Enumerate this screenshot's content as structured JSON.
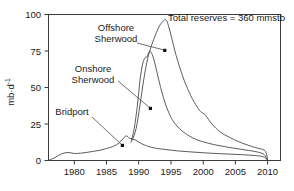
{
  "chart_data": {
    "type": "line",
    "title": "",
    "xlabel": "",
    "ylabel": "mb·d",
    "ylabel_sup": "-1",
    "xlim": [
      1976,
      2012
    ],
    "ylim": [
      0,
      100
    ],
    "grid": false,
    "legend_position": "inline-annotations",
    "x_ticks": [
      "1980",
      "1985",
      "1990",
      "1995",
      "2000",
      "2005",
      "2010"
    ],
    "x_tick_values": [
      1980,
      1985,
      1990,
      1995,
      2000,
      2005,
      2010
    ],
    "y_ticks": [
      "0",
      "25",
      "50",
      "75",
      "100"
    ],
    "y_tick_values": [
      0,
      25,
      50,
      75,
      100
    ],
    "annotations": [
      {
        "id": "total-reserves",
        "text": "Total reserves = 360 mmstb",
        "x": 1994.0,
        "y": 96.0
      },
      {
        "id": "offshore-sherwood",
        "line1": "Offshore",
        "line2": "Sherwood",
        "point_x": 1994.0,
        "point_y": 75.0
      },
      {
        "id": "onshore-sherwood",
        "line1": "Onshore",
        "line2": "Sherwood",
        "point_x": 1992.0,
        "point_y": 36.0
      },
      {
        "id": "bridport",
        "line1": "Bridport",
        "line2": "",
        "point_x": 1988.0,
        "point_y": 11.0
      }
    ],
    "series": [
      {
        "name": "Bridport",
        "color": "#4a4a4a",
        "x": [
          1976.0,
          1977.0,
          1978.0,
          1979.0,
          1980.0,
          1981.0,
          1982.0,
          1983.0,
          1984.0,
          1985.0,
          1986.0,
          1987.0,
          1988.0,
          1988.6,
          1989.5,
          1990.5,
          1992.0,
          1994.0,
          1996.0,
          1998.0,
          2000.0,
          2002.0,
          2004.0,
          2006.0,
          2008.0,
          2009.3,
          2009.8,
          2010.0
        ],
        "values": [
          0.0,
          2.0,
          4.5,
          5.5,
          4.8,
          5.0,
          5.6,
          6.3,
          7.0,
          8.2,
          9.6,
          12.2,
          16.8,
          15.2,
          14.0,
          11.4,
          9.0,
          7.6,
          6.6,
          5.9,
          5.3,
          4.8,
          4.4,
          4.0,
          3.4,
          2.6,
          1.0,
          0.0
        ]
      },
      {
        "name": "Onshore Sherwood",
        "color": "#4a4a4a",
        "x": [
          1988.8,
          1989.3,
          1989.8,
          1990.2,
          1990.6,
          1991.0,
          1991.3,
          1991.6,
          1991.9,
          1992.3,
          1992.8,
          1993.4,
          1994.2,
          1995.2,
          1996.4,
          1997.6,
          1999.0,
          2000.5,
          2002.0,
          2004.0,
          2006.0,
          2008.0,
          2009.3,
          2009.8,
          2010.0
        ],
        "values": [
          12.5,
          22.0,
          38.0,
          55.0,
          66.0,
          70.5,
          71.0,
          74.5,
          74.2,
          70.0,
          61.0,
          50.0,
          38.0,
          28.0,
          21.5,
          17.5,
          14.2,
          12.2,
          10.6,
          9.0,
          7.6,
          6.2,
          4.6,
          1.8,
          0.0
        ]
      },
      {
        "name": "Total",
        "color": "#4a4a4a",
        "x": [
          1989.0,
          1989.6,
          1990.2,
          1990.8,
          1991.4,
          1992.0,
          1992.6,
          1993.2,
          1993.8,
          1994.2,
          1994.5,
          1995.0,
          1995.8,
          1996.8,
          1997.8,
          1998.8,
          1999.6,
          2000.3,
          2001.0,
          2002.0,
          2003.0,
          2004.5,
          2006.0,
          2008.0,
          2009.5,
          2009.9,
          2010.0
        ],
        "values": [
          14.0,
          22.0,
          38.0,
          56.0,
          70.0,
          79.0,
          86.0,
          92.0,
          95.5,
          96.3,
          94.0,
          86.0,
          72.0,
          58.0,
          47.0,
          38.5,
          33.5,
          31.5,
          27.0,
          22.0,
          18.5,
          15.0,
          12.0,
          9.0,
          7.0,
          3.0,
          0.0
        ]
      }
    ]
  },
  "figure": {
    "axis_color": "#3a3a3a",
    "line_color": "#4a4a4a",
    "background": "#ffffff"
  }
}
